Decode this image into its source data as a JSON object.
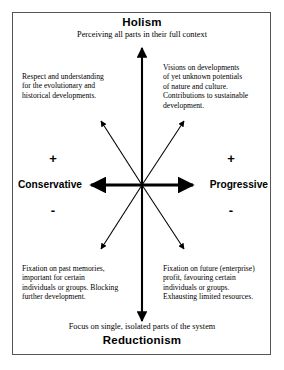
{
  "diagram": {
    "top_pole": {
      "heading": "Holism",
      "subtitle": "Perceiving all parts in their full context"
    },
    "bottom_pole": {
      "heading": "Reductionism",
      "subtitle": "Focus on single, isolated parts of the system"
    },
    "left_pole": {
      "label": "Conservative",
      "plus_sign": "+",
      "minus_sign": "-"
    },
    "right_pole": {
      "label": "Progressive",
      "plus_sign": "+",
      "minus_sign": "-"
    },
    "quadrants": {
      "top_left": "Respect and understanding\nfor the evolutionary and\nhistorical developments.",
      "top_right": "Visions on developments\nof yet unknown potentials\nof nature and culture.\nContributions to sustainable\ndevelopment.",
      "bottom_left": "Fixation on past memories,\nimportant for certain\nindividuals or groups. Blocking\nfurther development.",
      "bottom_right": "Fixation on future (enterprise)\nprofit, favouring certain\nindividuals or groups.\nExhausting limited resources."
    },
    "colors": {
      "stroke": "#000000",
      "frame": "#555555",
      "background": "#ffffff"
    }
  }
}
